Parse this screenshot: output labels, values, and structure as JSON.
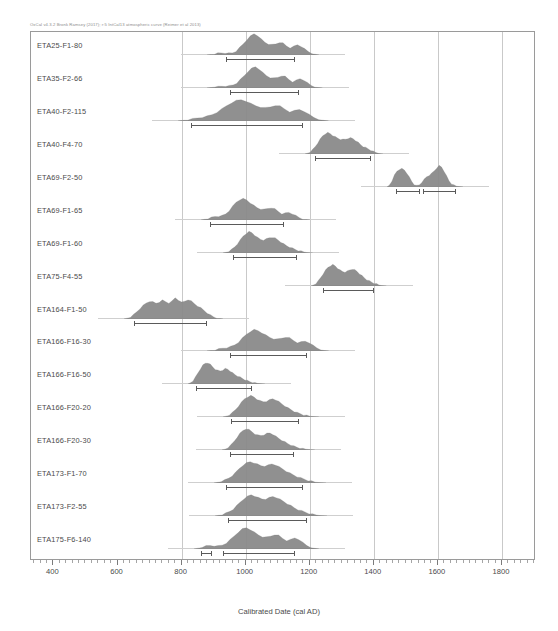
{
  "header": {
    "credit": "OxCal v4.3.2 Bronk Ramsey (2017); r:5 IntCal13 atmospheric curve (Reimer et al 2013)"
  },
  "footer": {
    "note": ""
  },
  "chart_data": {
    "type": "area",
    "title": "",
    "xlabel": "Calibrated Date (cal AD)",
    "ylabel": "",
    "xlim": [
      330,
      1900
    ],
    "grid": true,
    "gridlines": [
      800,
      1000,
      1200,
      1400,
      1600,
      1800
    ],
    "ticks": [
      400,
      600,
      800,
      1000,
      1200,
      1400,
      1600,
      1800
    ],
    "tick_labels": [
      "400",
      "600",
      "800",
      "1000",
      "1200",
      "1400",
      "1600",
      "1800"
    ],
    "minor_tick_step": 20,
    "legend": "",
    "series": [
      {
        "name": "ETA25-F1-80",
        "span": [
          880,
          1230
        ],
        "peak": 1020,
        "ranges": [
          [
            940,
            1155
          ]
        ],
        "density": [
          0.0,
          0.02,
          0.05,
          0.08,
          0.1,
          0.09,
          0.08,
          0.1,
          0.18,
          0.34,
          0.52,
          0.72,
          0.88,
          1.0,
          0.92,
          0.74,
          0.6,
          0.52,
          0.48,
          0.52,
          0.6,
          0.56,
          0.42,
          0.34,
          0.4,
          0.48,
          0.42,
          0.28,
          0.16,
          0.08,
          0.03,
          0.0
        ]
      },
      {
        "name": "ETA35-F2-66",
        "span": [
          880,
          1240
        ],
        "peak": 1035,
        "ranges": [
          [
            950,
            1165
          ]
        ],
        "density": [
          0.0,
          0.02,
          0.04,
          0.06,
          0.08,
          0.09,
          0.1,
          0.14,
          0.24,
          0.4,
          0.58,
          0.78,
          0.92,
          1.0,
          0.9,
          0.72,
          0.58,
          0.5,
          0.46,
          0.5,
          0.58,
          0.54,
          0.4,
          0.3,
          0.36,
          0.44,
          0.38,
          0.24,
          0.12,
          0.06,
          0.02,
          0.0
        ]
      },
      {
        "name": "ETA40-F2-115",
        "span": [
          790,
          1260
        ],
        "peak": 1030,
        "ranges": [
          [
            830,
            1180
          ]
        ],
        "density": [
          0.0,
          0.03,
          0.06,
          0.1,
          0.14,
          0.18,
          0.22,
          0.3,
          0.42,
          0.56,
          0.72,
          0.86,
          0.96,
          1.0,
          0.94,
          0.82,
          0.72,
          0.66,
          0.62,
          0.66,
          0.74,
          0.7,
          0.56,
          0.44,
          0.48,
          0.54,
          0.46,
          0.3,
          0.16,
          0.08,
          0.03,
          0.0
        ]
      },
      {
        "name": "ETA40-F4-70",
        "span": [
          1185,
          1430
        ],
        "peak": 1290,
        "ranges": [
          [
            1215,
            1390
          ]
        ],
        "density": [
          0.0,
          0.04,
          0.1,
          0.2,
          0.34,
          0.52,
          0.7,
          0.86,
          0.96,
          1.0,
          0.96,
          0.88,
          0.8,
          0.74,
          0.7,
          0.68,
          0.7,
          0.74,
          0.76,
          0.72,
          0.64,
          0.54,
          0.44,
          0.36,
          0.3,
          0.24,
          0.18,
          0.12,
          0.07,
          0.03,
          0.01,
          0.0
        ]
      },
      {
        "name": "ETA69-F2-50",
        "span": [
          1440,
          1680
        ],
        "peak": 1610,
        "ranges": [
          [
            1470,
            1545
          ],
          [
            1555,
            1655
          ]
        ],
        "density": [
          0.0,
          0.1,
          0.3,
          0.55,
          0.74,
          0.84,
          0.86,
          0.8,
          0.66,
          0.46,
          0.26,
          0.12,
          0.06,
          0.1,
          0.22,
          0.36,
          0.48,
          0.56,
          0.64,
          0.76,
          0.9,
          1.0,
          0.94,
          0.76,
          0.52,
          0.3,
          0.16,
          0.08,
          0.04,
          0.02,
          0.01,
          0.0
        ]
      },
      {
        "name": "ETA69-F1-65",
        "span": [
          860,
          1200
        ],
        "peak": 1000,
        "ranges": [
          [
            890,
            1120
          ]
        ],
        "density": [
          0.0,
          0.03,
          0.07,
          0.12,
          0.16,
          0.18,
          0.2,
          0.28,
          0.44,
          0.64,
          0.84,
          0.96,
          1.0,
          0.94,
          0.82,
          0.68,
          0.58,
          0.52,
          0.5,
          0.54,
          0.58,
          0.52,
          0.4,
          0.3,
          0.32,
          0.36,
          0.3,
          0.2,
          0.11,
          0.05,
          0.02,
          0.0
        ]
      },
      {
        "name": "ETA69-F1-60",
        "span": [
          930,
          1210
        ],
        "peak": 1055,
        "ranges": [
          [
            960,
            1160
          ]
        ],
        "density": [
          0.0,
          0.03,
          0.08,
          0.16,
          0.28,
          0.44,
          0.62,
          0.8,
          0.92,
          1.0,
          0.96,
          0.84,
          0.72,
          0.64,
          0.62,
          0.66,
          0.72,
          0.74,
          0.7,
          0.62,
          0.52,
          0.42,
          0.34,
          0.28,
          0.22,
          0.17,
          0.12,
          0.08,
          0.05,
          0.02,
          0.01,
          0.0
        ]
      },
      {
        "name": "ETA75-F4-55",
        "span": [
          1205,
          1440
        ],
        "peak": 1305,
        "ranges": [
          [
            1240,
            1400
          ]
        ],
        "density": [
          0.0,
          0.05,
          0.12,
          0.24,
          0.4,
          0.58,
          0.74,
          0.88,
          0.96,
          1.0,
          0.94,
          0.84,
          0.74,
          0.68,
          0.66,
          0.7,
          0.76,
          0.8,
          0.76,
          0.68,
          0.58,
          0.48,
          0.38,
          0.3,
          0.24,
          0.18,
          0.13,
          0.09,
          0.05,
          0.02,
          0.01,
          0.0
        ]
      },
      {
        "name": "ETA164-F1-50",
        "span": [
          620,
          930
        ],
        "peak": 790,
        "ranges": [
          [
            650,
            880
          ]
        ],
        "density": [
          0.0,
          0.04,
          0.1,
          0.2,
          0.34,
          0.5,
          0.64,
          0.76,
          0.84,
          0.8,
          0.74,
          0.8,
          0.88,
          0.82,
          0.76,
          0.84,
          1.0,
          0.9,
          0.78,
          0.84,
          0.92,
          0.84,
          0.72,
          0.62,
          0.52,
          0.4,
          0.28,
          0.18,
          0.1,
          0.05,
          0.02,
          0.0
        ]
      },
      {
        "name": "ETA166-F16-30",
        "span": [
          880,
          1260
        ],
        "peak": 1035,
        "ranges": [
          [
            950,
            1190
          ]
        ],
        "density": [
          0.0,
          0.02,
          0.05,
          0.09,
          0.13,
          0.16,
          0.2,
          0.28,
          0.42,
          0.6,
          0.78,
          0.92,
          1.0,
          0.96,
          0.86,
          0.74,
          0.64,
          0.58,
          0.56,
          0.6,
          0.66,
          0.62,
          0.5,
          0.4,
          0.42,
          0.46,
          0.4,
          0.26,
          0.14,
          0.07,
          0.02,
          0.0
        ]
      },
      {
        "name": "ETA166-F16-50",
        "span": [
          820,
          1060
        ],
        "peak": 910,
        "ranges": [
          [
            845,
            1020
          ]
        ],
        "density": [
          0.0,
          0.06,
          0.16,
          0.32,
          0.52,
          0.72,
          0.88,
          0.98,
          1.0,
          0.92,
          0.8,
          0.7,
          0.64,
          0.62,
          0.66,
          0.72,
          0.7,
          0.62,
          0.52,
          0.44,
          0.38,
          0.32,
          0.26,
          0.2,
          0.15,
          0.11,
          0.08,
          0.05,
          0.03,
          0.02,
          0.01,
          0.0
        ]
      },
      {
        "name": "ETA166-F20-20",
        "span": [
          930,
          1230
        ],
        "peak": 1045,
        "ranges": [
          [
            955,
            1165
          ]
        ],
        "density": [
          0.0,
          0.04,
          0.1,
          0.2,
          0.34,
          0.52,
          0.7,
          0.86,
          0.96,
          1.0,
          0.94,
          0.84,
          0.76,
          0.72,
          0.74,
          0.8,
          0.86,
          0.82,
          0.72,
          0.62,
          0.52,
          0.42,
          0.34,
          0.26,
          0.2,
          0.15,
          0.1,
          0.07,
          0.04,
          0.02,
          0.01,
          0.0
        ]
      },
      {
        "name": "ETA166-F20-30",
        "span": [
          925,
          1215
        ],
        "peak": 1040,
        "ranges": [
          [
            950,
            1150
          ]
        ],
        "density": [
          0.0,
          0.04,
          0.12,
          0.24,
          0.4,
          0.6,
          0.78,
          0.92,
          1.0,
          0.96,
          0.86,
          0.76,
          0.7,
          0.68,
          0.72,
          0.78,
          0.8,
          0.74,
          0.64,
          0.54,
          0.46,
          0.38,
          0.3,
          0.24,
          0.18,
          0.13,
          0.09,
          0.06,
          0.04,
          0.02,
          0.01,
          0.0
        ]
      },
      {
        "name": "ETA173-F1-70",
        "span": [
          900,
          1250
        ],
        "peak": 1060,
        "ranges": [
          [
            940,
            1180
          ]
        ],
        "density": [
          0.0,
          0.03,
          0.08,
          0.14,
          0.22,
          0.34,
          0.5,
          0.68,
          0.84,
          0.94,
          1.0,
          0.96,
          0.88,
          0.82,
          0.8,
          0.84,
          0.9,
          0.86,
          0.76,
          0.66,
          0.56,
          0.46,
          0.38,
          0.3,
          0.24,
          0.18,
          0.12,
          0.08,
          0.04,
          0.02,
          0.01,
          0.0
        ]
      },
      {
        "name": "ETA173-F2-55",
        "span": [
          905,
          1255
        ],
        "peak": 1070,
        "ranges": [
          [
            945,
            1190
          ]
        ],
        "density": [
          0.0,
          0.03,
          0.07,
          0.13,
          0.21,
          0.32,
          0.48,
          0.66,
          0.82,
          0.92,
          1.0,
          0.94,
          0.86,
          0.8,
          0.8,
          0.86,
          0.92,
          0.88,
          0.78,
          0.68,
          0.58,
          0.48,
          0.38,
          0.3,
          0.24,
          0.18,
          0.12,
          0.08,
          0.05,
          0.02,
          0.01,
          0.0
        ]
      },
      {
        "name": "ETA175-F6-140",
        "span": [
          840,
          1230
        ],
        "peak": 1050,
        "ranges": [
          [
            860,
            895
          ],
          [
            930,
            1155
          ]
        ],
        "density": [
          0.0,
          0.04,
          0.09,
          0.14,
          0.16,
          0.15,
          0.14,
          0.18,
          0.28,
          0.44,
          0.62,
          0.8,
          0.94,
          1.0,
          0.92,
          0.78,
          0.66,
          0.58,
          0.56,
          0.6,
          0.68,
          0.64,
          0.5,
          0.4,
          0.44,
          0.52,
          0.46,
          0.3,
          0.16,
          0.08,
          0.03,
          0.0
        ]
      }
    ]
  }
}
